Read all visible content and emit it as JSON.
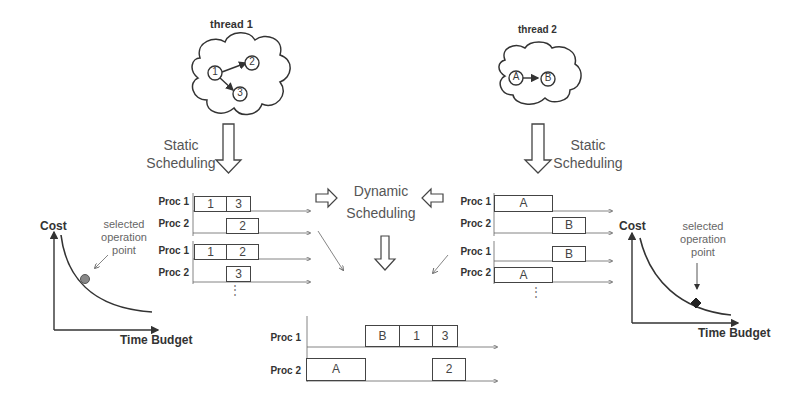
{
  "threads": [
    {
      "title": "thread 1",
      "nodes": [
        "1",
        "2",
        "3"
      ],
      "edges": [
        [
          "1",
          "2"
        ],
        [
          "1",
          "3"
        ]
      ]
    },
    {
      "title": "thread 2",
      "nodes": [
        "A",
        "B"
      ],
      "edges": [
        [
          "A",
          "B"
        ]
      ]
    }
  ],
  "labels": {
    "static_scheduling_left": [
      "Static",
      "Scheduling"
    ],
    "static_scheduling_right": [
      "Static",
      "Scheduling"
    ],
    "dynamic_scheduling": [
      "Dynamic",
      "Scheduling"
    ],
    "ellipsis": "⋮"
  },
  "schedules_thread1": [
    {
      "proc1": [
        "1",
        "3"
      ],
      "proc2": [
        "2"
      ]
    },
    {
      "proc1": [
        "1",
        "2"
      ],
      "proc2": [
        "3"
      ]
    }
  ],
  "schedules_thread2": [
    {
      "proc1": [
        "A"
      ],
      "proc2": [
        "B"
      ]
    },
    {
      "proc1": [
        "B"
      ],
      "proc2": [
        "A"
      ]
    }
  ],
  "final_schedule": {
    "proc1": [
      "B",
      "1",
      "3"
    ],
    "proc2": [
      "A",
      "2"
    ]
  },
  "proc_labels": {
    "p1": "Proc 1",
    "p2": "Proc 2"
  },
  "cost_charts": [
    {
      "ylabel": "Cost",
      "xlabel": "Time Budget",
      "annotation": [
        "selected",
        "operation",
        "point"
      ],
      "marker": "gray-circle"
    },
    {
      "ylabel": "Cost",
      "xlabel": "Time Budget",
      "annotation": [
        "selected",
        "operation",
        "point"
      ],
      "marker": "black-diamond"
    }
  ],
  "colors": {
    "line": "#333333",
    "arrow": "#555555",
    "marker_left": "#888888",
    "marker_right": "#222222"
  }
}
